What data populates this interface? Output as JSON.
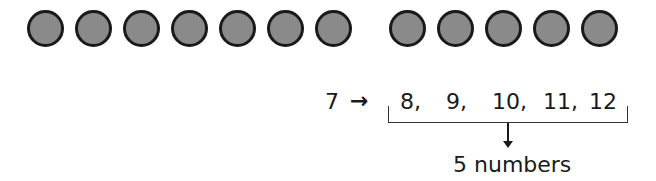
{
  "diagram": {
    "left_group": {
      "count": 7,
      "color": "#8a8a8a",
      "outline": "#1a1a1a"
    },
    "right_group": {
      "count": 5,
      "color": "#8a8a8a",
      "outline": "#1a1a1a"
    },
    "start_number": "7",
    "arrow": "→",
    "sequence": [
      "8,",
      "9,",
      "10,",
      "11,",
      "12"
    ],
    "down_arrow": "↓",
    "result_label": "5 numbers"
  }
}
